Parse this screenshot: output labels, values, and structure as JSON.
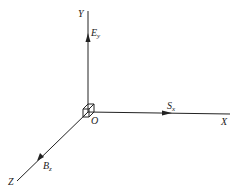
{
  "diagram": {
    "type": "3d-coordinate-axes",
    "origin_label": "O",
    "axes": [
      {
        "name": "X",
        "label": "X"
      },
      {
        "name": "Y",
        "label": "Y"
      },
      {
        "name": "Z",
        "label": "Z"
      }
    ],
    "vectors": [
      {
        "name": "E",
        "subscript": "y",
        "axis": "Y"
      },
      {
        "name": "S",
        "subscript": "x",
        "axis": "X"
      },
      {
        "name": "B",
        "subscript": "z",
        "axis": "Z"
      }
    ],
    "colors": {
      "line": "#222222",
      "background": "#ffffff"
    }
  }
}
